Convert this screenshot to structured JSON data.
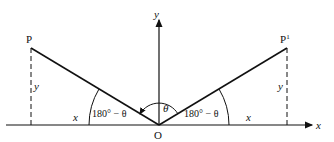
{
  "labels": {
    "P": "P",
    "P_prime": "P",
    "P_prime_sup": "1",
    "O": "O",
    "x_axis": "x",
    "y_axis": "y",
    "y_left": "y",
    "y_right": "y",
    "x_left": "x",
    "x_right": "x",
    "angle_left": "180° − θ",
    "angle_right": "180° − θ",
    "theta": "θ"
  },
  "colors": {
    "line": "#111111",
    "background": "#ffffff"
  }
}
